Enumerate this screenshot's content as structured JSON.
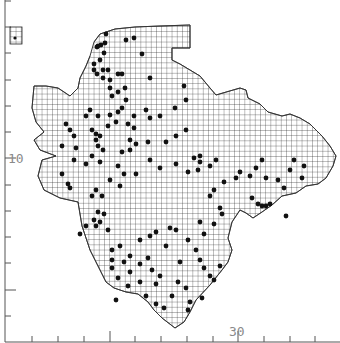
{
  "map": {
    "type": "distribution-dot-map",
    "grid_cell_px": 5.2,
    "colors": {
      "background": "#ffffff",
      "grid": "#222222",
      "dot": "#111111",
      "axis": "#555555",
      "label": "#8a8a8a",
      "coast": "#333333"
    },
    "axes": {
      "left": {
        "label": "10",
        "label_y": 158,
        "ticks_y": [
          1,
          27,
          53,
          80,
          106,
          132,
          158,
          185,
          211,
          237,
          263,
          290,
          316
        ]
      },
      "bottom": {
        "label": "30",
        "label_x": 238,
        "ticks_x": [
          32,
          58,
          84,
          110,
          135,
          161,
          187,
          213,
          238,
          264,
          290,
          315
        ]
      }
    },
    "key_box": {
      "x": 10,
      "y": 27,
      "w": 12,
      "h": 17
    },
    "outline": [
      [
        94,
        42
      ],
      [
        100,
        34
      ],
      [
        115,
        29
      ],
      [
        135,
        27
      ],
      [
        160,
        26
      ],
      [
        190,
        25
      ],
      [
        190,
        48
      ],
      [
        172,
        48
      ],
      [
        172,
        60
      ],
      [
        180,
        64
      ],
      [
        190,
        70
      ],
      [
        200,
        76
      ],
      [
        205,
        82
      ],
      [
        210,
        88
      ],
      [
        216,
        95
      ],
      [
        240,
        88
      ],
      [
        246,
        90
      ],
      [
        248,
        98
      ],
      [
        260,
        104
      ],
      [
        268,
        112
      ],
      [
        282,
        116
      ],
      [
        290,
        114
      ],
      [
        300,
        118
      ],
      [
        310,
        124
      ],
      [
        322,
        136
      ],
      [
        330,
        146
      ],
      [
        336,
        156
      ],
      [
        333,
        166
      ],
      [
        326,
        178
      ],
      [
        318,
        184
      ],
      [
        306,
        186
      ],
      [
        296,
        193
      ],
      [
        282,
        196
      ],
      [
        272,
        205
      ],
      [
        262,
        212
      ],
      [
        253,
        218
      ],
      [
        246,
        213
      ],
      [
        240,
        210
      ],
      [
        232,
        222
      ],
      [
        228,
        238
      ],
      [
        232,
        250
      ],
      [
        228,
        262
      ],
      [
        222,
        270
      ],
      [
        210,
        285
      ],
      [
        196,
        300
      ],
      [
        190,
        312
      ],
      [
        184,
        322
      ],
      [
        175,
        328
      ],
      [
        162,
        318
      ],
      [
        154,
        310
      ],
      [
        148,
        302
      ],
      [
        138,
        294
      ],
      [
        126,
        292
      ],
      [
        114,
        288
      ],
      [
        106,
        282
      ],
      [
        100,
        270
      ],
      [
        96,
        262
      ],
      [
        90,
        250
      ],
      [
        86,
        238
      ],
      [
        82,
        226
      ],
      [
        80,
        214
      ],
      [
        78,
        202
      ],
      [
        60,
        198
      ],
      [
        44,
        190
      ],
      [
        38,
        176
      ],
      [
        42,
        160
      ],
      [
        56,
        156
      ],
      [
        40,
        150
      ],
      [
        34,
        140
      ],
      [
        44,
        132
      ],
      [
        36,
        122
      ],
      [
        32,
        108
      ],
      [
        34,
        86
      ],
      [
        46,
        86
      ],
      [
        58,
        88
      ],
      [
        70,
        96
      ],
      [
        78,
        88
      ],
      [
        80,
        78
      ],
      [
        86,
        66
      ],
      [
        90,
        56
      ]
    ],
    "dots": [
      [
        97,
        47
      ],
      [
        101,
        45
      ],
      [
        105,
        43
      ],
      [
        104,
        53
      ],
      [
        100,
        60
      ],
      [
        94,
        64
      ],
      [
        94,
        70
      ],
      [
        97,
        74
      ],
      [
        103,
        70
      ],
      [
        108,
        70
      ],
      [
        103,
        78
      ],
      [
        110,
        80
      ],
      [
        118,
        74
      ],
      [
        110,
        88
      ],
      [
        112,
        96
      ],
      [
        118,
        92
      ],
      [
        125,
        88
      ],
      [
        122,
        74
      ],
      [
        142,
        54
      ],
      [
        150,
        78
      ],
      [
        126,
        100
      ],
      [
        122,
        108
      ],
      [
        118,
        112
      ],
      [
        110,
        115
      ],
      [
        98,
        116
      ],
      [
        108,
        126
      ],
      [
        116,
        122
      ],
      [
        128,
        124
      ],
      [
        134,
        128
      ],
      [
        134,
        116
      ],
      [
        146,
        110
      ],
      [
        150,
        118
      ],
      [
        160,
        116
      ],
      [
        175,
        108
      ],
      [
        186,
        100
      ],
      [
        184,
        86
      ],
      [
        126,
        40
      ],
      [
        134,
        38
      ],
      [
        106,
        34
      ],
      [
        98,
        46
      ],
      [
        66,
        124
      ],
      [
        70,
        130
      ],
      [
        62,
        146
      ],
      [
        74,
        136
      ],
      [
        76,
        148
      ],
      [
        74,
        160
      ],
      [
        86,
        116
      ],
      [
        90,
        110
      ],
      [
        92,
        130
      ],
      [
        96,
        134
      ],
      [
        100,
        136
      ],
      [
        96,
        140
      ],
      [
        98,
        146
      ],
      [
        103,
        150
      ],
      [
        92,
        156
      ],
      [
        86,
        164
      ],
      [
        100,
        162
      ],
      [
        118,
        166
      ],
      [
        122,
        152
      ],
      [
        130,
        150
      ],
      [
        130,
        140
      ],
      [
        136,
        144
      ],
      [
        148,
        142
      ],
      [
        166,
        142
      ],
      [
        176,
        136
      ],
      [
        186,
        130
      ],
      [
        194,
        158
      ],
      [
        200,
        156
      ],
      [
        200,
        162
      ],
      [
        216,
        160
      ],
      [
        210,
        166
      ],
      [
        198,
        170
      ],
      [
        188,
        172
      ],
      [
        176,
        164
      ],
      [
        160,
        168
      ],
      [
        150,
        160
      ],
      [
        136,
        174
      ],
      [
        124,
        174
      ],
      [
        120,
        186
      ],
      [
        110,
        180
      ],
      [
        96,
        190
      ],
      [
        92,
        196
      ],
      [
        102,
        196
      ],
      [
        98,
        212
      ],
      [
        104,
        214
      ],
      [
        68,
        184
      ],
      [
        70,
        188
      ],
      [
        62,
        174
      ],
      [
        86,
        226
      ],
      [
        80,
        234
      ],
      [
        94,
        220
      ],
      [
        100,
        222
      ],
      [
        96,
        226
      ],
      [
        108,
        230
      ],
      [
        112,
        250
      ],
      [
        112,
        260
      ],
      [
        112,
        268
      ],
      [
        118,
        278
      ],
      [
        120,
        246
      ],
      [
        140,
        240
      ],
      [
        150,
        236
      ],
      [
        156,
        232
      ],
      [
        170,
        228
      ],
      [
        176,
        230
      ],
      [
        188,
        240
      ],
      [
        196,
        250
      ],
      [
        200,
        260
      ],
      [
        204,
        268
      ],
      [
        210,
        276
      ],
      [
        220,
        266
      ],
      [
        214,
        280
      ],
      [
        180,
        262
      ],
      [
        166,
        246
      ],
      [
        148,
        258
      ],
      [
        152,
        270
      ],
      [
        130,
        272
      ],
      [
        124,
        262
      ],
      [
        130,
        256
      ],
      [
        140,
        264
      ],
      [
        156,
        284
      ],
      [
        160,
        276
      ],
      [
        172,
        296
      ],
      [
        178,
        282
      ],
      [
        186,
        288
      ],
      [
        190,
        302
      ],
      [
        202,
        298
      ],
      [
        188,
        310
      ],
      [
        200,
        222
      ],
      [
        204,
        234
      ],
      [
        214,
        224
      ],
      [
        220,
        208
      ],
      [
        222,
        214
      ],
      [
        210,
        196
      ],
      [
        214,
        190
      ],
      [
        224,
        182
      ],
      [
        236,
        178
      ],
      [
        240,
        172
      ],
      [
        250,
        176
      ],
      [
        256,
        168
      ],
      [
        262,
        160
      ],
      [
        266,
        178
      ],
      [
        278,
        180
      ],
      [
        284,
        188
      ],
      [
        290,
        170
      ],
      [
        294,
        160
      ],
      [
        304,
        166
      ],
      [
        302,
        178
      ],
      [
        252,
        198
      ],
      [
        258,
        204
      ],
      [
        262,
        206
      ],
      [
        266,
        206
      ],
      [
        270,
        204
      ],
      [
        286,
        216
      ],
      [
        116,
        300
      ],
      [
        128,
        286
      ],
      [
        140,
        282
      ],
      [
        146,
        296
      ],
      [
        156,
        304
      ],
      [
        164,
        308
      ]
    ]
  }
}
